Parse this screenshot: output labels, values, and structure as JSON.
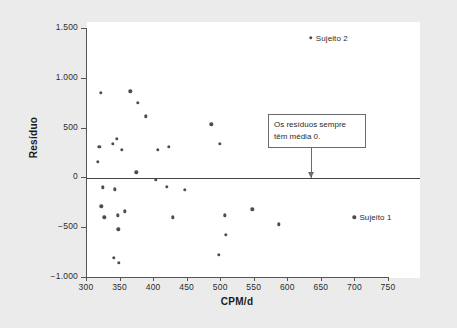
{
  "chart_data": {
    "type": "scatter",
    "title": "",
    "xlabel": "CPM/d",
    "ylabel": "Resíduo",
    "xlim": [
      300,
      750
    ],
    "ylim": [
      -1000,
      1500
    ],
    "xticks": [
      "300",
      "350",
      "400",
      "450",
      "500",
      "550",
      "600",
      "650",
      "700",
      "750"
    ],
    "xtick_values": [
      300,
      350,
      400,
      450,
      500,
      550,
      600,
      650,
      700,
      750
    ],
    "yticks": [
      "1.500",
      "1.000",
      "500",
      "0",
      "−500",
      "−1.000"
    ],
    "ytick_values": [
      1500,
      1000,
      500,
      0,
      -500,
      -1000
    ],
    "grid": false,
    "legend": false,
    "reference_line": {
      "axis": "y",
      "value": 0
    },
    "points": [
      {
        "x": 318,
        "y": 155
      },
      {
        "x": 320,
        "y": 310
      },
      {
        "x": 322,
        "y": 850
      },
      {
        "x": 323,
        "y": -290
      },
      {
        "x": 325,
        "y": -100
      },
      {
        "x": 327,
        "y": -400
      },
      {
        "x": 340,
        "y": 340
      },
      {
        "x": 341,
        "y": -810
      },
      {
        "x": 343,
        "y": -120
      },
      {
        "x": 346,
        "y": 390
      },
      {
        "x": 347,
        "y": -380
      },
      {
        "x": 348,
        "y": -520
      },
      {
        "x": 349,
        "y": -860
      },
      {
        "x": 353,
        "y": 275
      },
      {
        "x": 358,
        "y": -340
      },
      {
        "x": 366,
        "y": 865
      },
      {
        "x": 375,
        "y": 50
      },
      {
        "x": 377,
        "y": 750
      },
      {
        "x": 389,
        "y": 615
      },
      {
        "x": 404,
        "y": -25
      },
      {
        "x": 407,
        "y": 275
      },
      {
        "x": 420,
        "y": -95
      },
      {
        "x": 423,
        "y": 310
      },
      {
        "x": 429,
        "y": -400
      },
      {
        "x": 447,
        "y": -125
      },
      {
        "x": 487,
        "y": 535
      },
      {
        "x": 498,
        "y": -775
      },
      {
        "x": 499,
        "y": 335
      },
      {
        "x": 507,
        "y": -380
      },
      {
        "x": 508,
        "y": -575
      },
      {
        "x": 548,
        "y": -320
      },
      {
        "x": 587,
        "y": -470
      }
    ],
    "labeled_points": [
      {
        "label": "Sujeito 2",
        "x": 635,
        "y": 1400
      },
      {
        "label": "Sujeito 1",
        "x": 700,
        "y": -400
      }
    ],
    "annotation": {
      "line1": "Os resíduos sempre",
      "line2": "têm média 0.",
      "points_to": {
        "x": 635,
        "y": 0
      }
    }
  },
  "colors": {
    "background": "#ebebeb",
    "panel": "#ffffff",
    "point": "#4d4d4d",
    "axis": "#555555",
    "zero_line": "#444444",
    "text": "#2b2b2b",
    "callout_border": "#6b6b6b"
  }
}
